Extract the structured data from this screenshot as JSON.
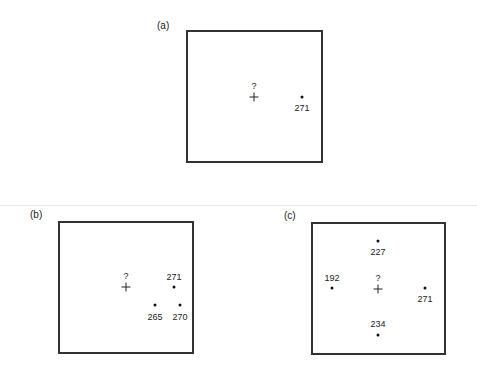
{
  "panels": [
    {
      "id": "a",
      "label": "(a)",
      "target": {
        "marker": "+",
        "query": "?"
      },
      "points": [
        {
          "value": "271"
        }
      ]
    },
    {
      "id": "b",
      "label": "(b)",
      "target": {
        "marker": "+",
        "query": "?"
      },
      "points": [
        {
          "value": "271"
        },
        {
          "value": "265"
        },
        {
          "value": "270"
        }
      ]
    },
    {
      "id": "c",
      "label": "(c)",
      "target": {
        "marker": "+",
        "query": "?"
      },
      "points": [
        {
          "value": "227"
        },
        {
          "value": "192"
        },
        {
          "value": "271"
        },
        {
          "value": "234"
        }
      ]
    }
  ]
}
